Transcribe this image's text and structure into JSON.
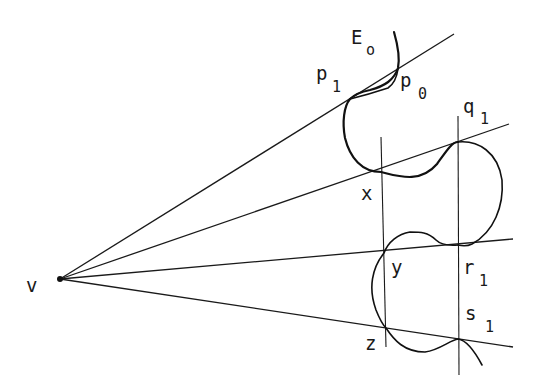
{
  "figure": {
    "colors": {
      "ink": "#1a1a1a",
      "background": "#ffffff"
    },
    "vertex": {
      "label": "v",
      "x": 60,
      "y": 279
    },
    "rays": [
      {
        "name": "ray-1",
        "end": [
          454,
          34
        ]
      },
      {
        "name": "ray-2",
        "end": [
          509,
          124
        ]
      },
      {
        "name": "ray-3",
        "end": [
          513,
          239
        ]
      },
      {
        "name": "ray-4",
        "end": [
          513,
          347
        ]
      }
    ],
    "verticals": [
      {
        "name": "vertical-left",
        "x1": 381,
        "y1": 137,
        "x2": 386,
        "y2": 347
      },
      {
        "name": "vertical-right",
        "x1": 458,
        "y1": 116,
        "x2": 459,
        "y2": 375
      }
    ],
    "labels": {
      "E": "E",
      "E_sub": "o",
      "p1": "p",
      "p1_sub": "1",
      "p0": "p",
      "p0_sub": "0",
      "q1": "q",
      "q1_sub": "1",
      "x": "x",
      "y": "y",
      "z": "z",
      "r1": "r",
      "r1_sub": "1",
      "s1": "s",
      "s1_sub": "1",
      "v": "v"
    }
  }
}
